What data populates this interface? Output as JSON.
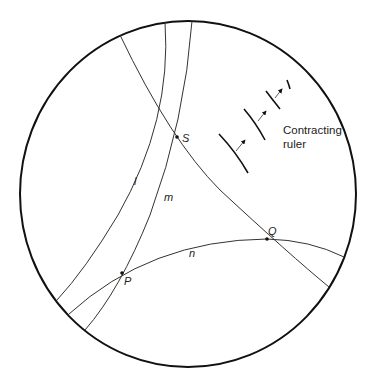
{
  "diagram": {
    "boundary": {
      "shape": "circle",
      "cx": 188,
      "cy": 194,
      "rx": 168,
      "ry": 173,
      "color": "#111111"
    },
    "lines": [
      {
        "id": "l",
        "label": "l"
      },
      {
        "id": "m",
        "label": "m"
      },
      {
        "id": "n",
        "label": "n"
      },
      {
        "id": "SQ",
        "label": ""
      }
    ],
    "points": [
      {
        "id": "S",
        "label": "S",
        "x": 177,
        "y": 137
      },
      {
        "id": "Q",
        "label": "Q",
        "x": 267,
        "y": 239
      },
      {
        "id": "P",
        "label": "P",
        "x": 122,
        "y": 273
      }
    ],
    "line_labels": {
      "l": "l",
      "m": "m",
      "n": "n"
    },
    "annotation": {
      "line1": "Contracting",
      "line2": "ruler"
    },
    "colors": {
      "stroke": "#333333",
      "boundary": "#111111",
      "background": "#ffffff"
    }
  }
}
